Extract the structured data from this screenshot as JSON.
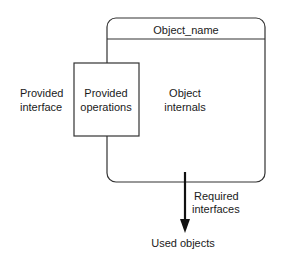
{
  "diagram": {
    "object": {
      "name": "Object_name",
      "internals_line1": "Object",
      "internals_line2": "internals"
    },
    "provided_operations": {
      "line1": "Provided",
      "line2": "operations"
    },
    "provided_interface": {
      "line1": "Provided",
      "line2": "interface"
    },
    "required_interfaces": {
      "line1": "Required",
      "line2": "interfaces"
    },
    "used_objects": "Used objects",
    "colors": {
      "stroke": "#333333",
      "text": "#1a1a1a",
      "background": "#ffffff"
    }
  }
}
